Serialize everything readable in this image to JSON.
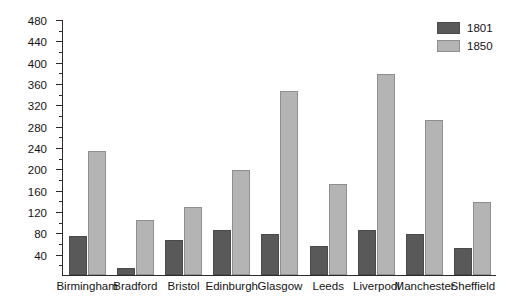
{
  "chart_data": {
    "type": "bar",
    "title": "",
    "xlabel": "",
    "ylabel": "Population (1000s)",
    "ylim": [
      0,
      480
    ],
    "ytick_step": 40,
    "yticks": [
      40,
      80,
      120,
      160,
      200,
      240,
      280,
      320,
      360,
      400,
      440,
      480
    ],
    "ytick_labels": [
      "40",
      "80",
      "120",
      "160",
      "200",
      "240",
      "280",
      "320",
      "360",
      "400",
      "440",
      "480"
    ],
    "minor_ticks": true,
    "grid": false,
    "legend_position": "top-right",
    "categories": [
      "Birmingham",
      "Bradford",
      "Bristol",
      "Edinburgh",
      "Glasgow",
      "Leeds",
      "Liverpool",
      "Manchester",
      "Sheffield"
    ],
    "series": [
      {
        "name": "1801",
        "color": "#595959",
        "values": [
          74,
          13,
          66,
          85,
          77,
          55,
          84,
          77,
          50
        ]
      },
      {
        "name": "1850",
        "color": "#b4b4b4",
        "values": [
          232,
          103,
          128,
          196,
          345,
          170,
          376,
          291,
          137
        ]
      }
    ]
  },
  "legend": {
    "entries": [
      {
        "label": "1801"
      },
      {
        "label": "1850"
      }
    ]
  },
  "colors": {
    "series_1801": "#595959",
    "series_1850": "#b4b4b4",
    "axis": "#2b2b2b",
    "text": "#141414",
    "background": "#ffffff"
  }
}
